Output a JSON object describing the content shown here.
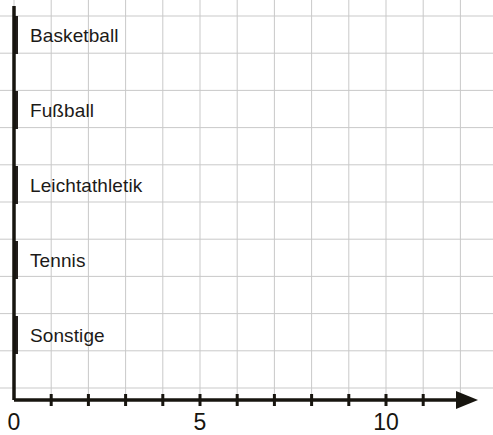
{
  "chart_data": {
    "type": "bar",
    "orientation": "horizontal",
    "title": "",
    "subtitle": "",
    "xlabel": "",
    "ylabel": "",
    "categories": [
      "Basketball",
      "Fußball",
      "Leichtathletik",
      "Tennis",
      "Sonstige"
    ],
    "values": [
      9,
      12,
      8,
      4,
      11
    ],
    "series": [
      {
        "name": "Anzahl",
        "values": [
          9,
          12,
          8,
          4,
          11
        ]
      }
    ],
    "xlim": [
      0,
      12.4
    ],
    "x_tick_values": [
      0,
      1,
      2,
      3,
      4,
      5,
      6,
      7,
      8,
      9,
      10,
      11,
      12
    ],
    "x_tick_labels_shown": [
      "0",
      "5",
      "10"
    ],
    "x_tick_label_values": [
      0,
      5,
      10
    ],
    "grid": true,
    "grid_spacing_units": 1,
    "legend": false,
    "legend_position": "none",
    "annotations": [],
    "axis_arrow_x": true,
    "axis_arrow_y": false,
    "bar_labels_inside": true,
    "colors": {
      "bar_fill": "#f2dfae",
      "bar_stroke": "#231f1c",
      "axis": "#17150f",
      "grid": "#c9c9c9",
      "background": "#ffffff",
      "label_text": "#1c1a18",
      "tick_text": "#17150f"
    }
  },
  "bars": [
    {
      "label": "Basketball",
      "value": 9,
      "value_text": "9"
    },
    {
      "label": "Fußball",
      "value": 12,
      "value_text": "12"
    },
    {
      "label": "Leichtathletik",
      "value": 8,
      "value_text": "8"
    },
    {
      "label": "Tennis",
      "value": 4,
      "value_text": "4"
    },
    {
      "label": "Sonstige",
      "value": 11,
      "value_text": "11"
    }
  ],
  "x_axis": {
    "ticks": [
      {
        "value": 0,
        "label": "0"
      },
      {
        "value": 1,
        "label": ""
      },
      {
        "value": 2,
        "label": ""
      },
      {
        "value": 3,
        "label": ""
      },
      {
        "value": 4,
        "label": ""
      },
      {
        "value": 5,
        "label": "5"
      },
      {
        "value": 6,
        "label": ""
      },
      {
        "value": 7,
        "label": ""
      },
      {
        "value": 8,
        "label": ""
      },
      {
        "value": 9,
        "label": ""
      },
      {
        "value": 10,
        "label": "10"
      },
      {
        "value": 11,
        "label": ""
      },
      {
        "value": 12,
        "label": ""
      }
    ]
  },
  "geometry": {
    "origin_x": 14,
    "unit_px": 37.2,
    "axis_y": 400,
    "bar_height": 38,
    "bar_gap": 37,
    "first_bar_top": 16,
    "axis_end_x": 478,
    "y_axis_top": 6
  }
}
